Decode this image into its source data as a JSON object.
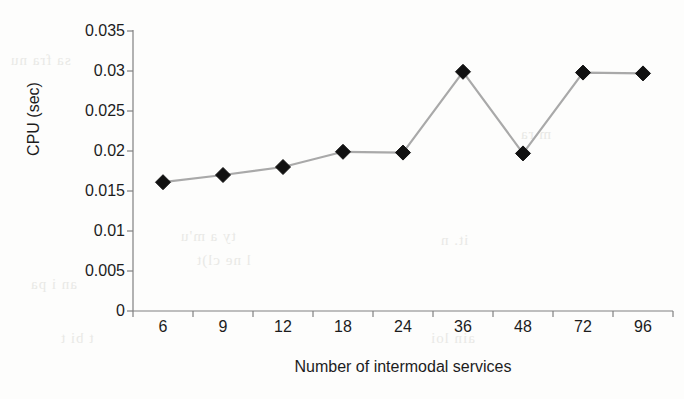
{
  "chart_data": {
    "type": "line",
    "title": "",
    "xlabel": "Number of intermodal services",
    "ylabel": "CPU (sec)",
    "categories": [
      "6",
      "9",
      "12",
      "18",
      "24",
      "36",
      "48",
      "72",
      "96"
    ],
    "values": [
      0.0161,
      0.017,
      0.018,
      0.0199,
      0.0198,
      0.0299,
      0.0197,
      0.0298,
      0.0297
    ],
    "ylim": [
      0,
      0.035
    ],
    "ytick_labels": [
      "0.035",
      "0.03",
      "0.025",
      "0.02",
      "0.015",
      "0.01",
      "0.005",
      "0"
    ],
    "ytick_values": [
      0.035,
      0.03,
      0.025,
      0.02,
      0.015,
      0.01,
      0.005,
      0
    ],
    "grid": false,
    "legend": false,
    "marker": "diamond",
    "marker_color": "#111111",
    "line_color": "#a9a9a9",
    "axis_color": "#808080",
    "background": "#fdfdfc"
  },
  "artifacts": {
    "bleed_text": [
      "sa fra nu",
      "ty a m'u",
      "l ne cl)t",
      "an i pa",
      "it. n",
      "m ra",
      "t bi t",
      "ain loi"
    ]
  }
}
